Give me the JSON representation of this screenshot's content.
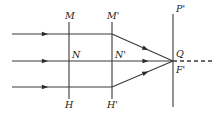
{
  "figure": {
    "kind": "optical-ray-diagram",
    "width": 219,
    "height": 115,
    "background_color": "#ffffff",
    "stroke_color": "#3a3a3a",
    "label_color": "#1a1a1a",
    "labels": {
      "m": "M",
      "m_prime": "M'",
      "n": "N",
      "n_prime": "N'",
      "h": "H",
      "h_prime": "H'",
      "p_prime": "P'",
      "q": "Q",
      "f_prime": "F'"
    },
    "planes": [
      {
        "name": "principal-plane-first",
        "x": 69,
        "y_top": 22,
        "y_bottom": 99,
        "top_label": "M",
        "bottom_label": "H",
        "mid_label": "N"
      },
      {
        "name": "principal-plane-second",
        "x": 112,
        "y_top": 22,
        "y_bottom": 99,
        "top_label": "M'",
        "bottom_label": "H'",
        "mid_label": "N'"
      },
      {
        "name": "focal-plane",
        "x": 173,
        "y_top": 14,
        "y_bottom": 107,
        "top_label": "P'",
        "bottom_label": "F'",
        "mid_label": "Q"
      }
    ],
    "incoming_rays": [
      {
        "name": "incoming-ray-upper",
        "y": 34,
        "x_start": 12,
        "x_end": 112,
        "arrow_x": 45
      },
      {
        "name": "incoming-ray-middle",
        "y": 61,
        "x_start": 12,
        "x_end": 112,
        "arrow_x": 45
      },
      {
        "name": "incoming-ray-lower",
        "y": 87,
        "x_start": 12,
        "x_end": 112,
        "arrow_x": 45
      }
    ],
    "converging_rays": [
      {
        "name": "converging-ray-upper",
        "x_start": 112,
        "y_start": 34,
        "x_end": 173,
        "y_end": 61,
        "arrow_t": 0.55
      },
      {
        "name": "converging-ray-middle",
        "x_start": 112,
        "y_start": 61,
        "x_end": 173,
        "y_end": 61,
        "arrow_t": 0.55
      },
      {
        "name": "converging-ray-lower",
        "x_start": 112,
        "y_start": 87,
        "x_end": 173,
        "y_end": 61,
        "arrow_t": 0.55
      }
    ],
    "axis": {
      "name": "optical-axis-dashed",
      "x_start": 173,
      "x_end": 212,
      "y": 61,
      "dash_pattern": "4,3"
    },
    "focus_point": {
      "name": "focus-point",
      "x": 173,
      "y": 61
    },
    "label_positions": {
      "m": {
        "x": 65,
        "y": 11
      },
      "m_prime": {
        "x": 107,
        "y": 11
      },
      "n": {
        "x": 72,
        "y": 50
      },
      "n_prime": {
        "x": 115,
        "y": 50
      },
      "h": {
        "x": 65,
        "y": 100
      },
      "h_prime": {
        "x": 107,
        "y": 100
      },
      "p_prime": {
        "x": 176,
        "y": 4
      },
      "q": {
        "x": 176,
        "y": 49
      },
      "f_prime": {
        "x": 176,
        "y": 65
      }
    }
  }
}
